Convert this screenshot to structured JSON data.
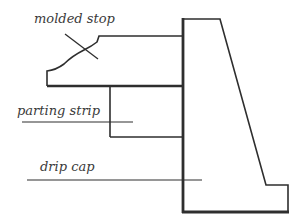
{
  "diagram": {
    "labels": {
      "molded_stop": "molded stop",
      "parting_strip": "parting strip",
      "drip_cap": "drip cap"
    },
    "colors": {
      "stroke": "#2e2e2e",
      "text": "#3a3a3a",
      "background": "#ffffff"
    }
  }
}
